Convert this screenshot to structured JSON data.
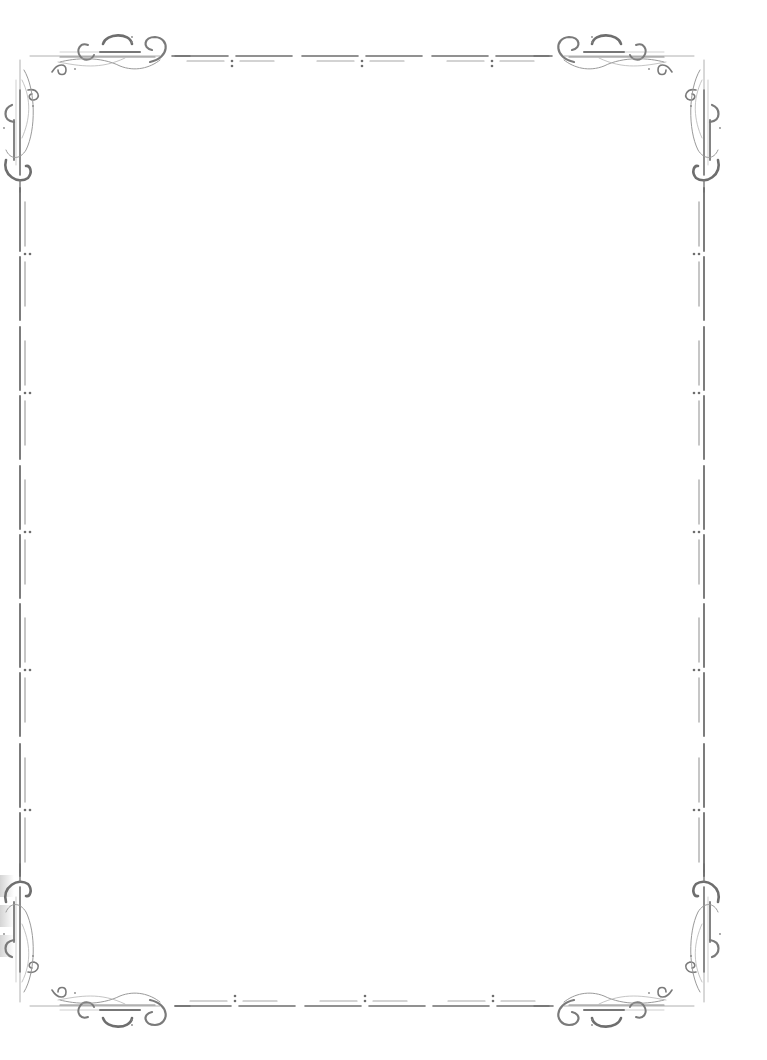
{
  "document": {
    "type": "decorative-page-border",
    "background": "#ffffff",
    "body_text": ""
  },
  "border": {
    "stroke_color": "#6e6e6e",
    "light_stroke_color": "#a8a8a8",
    "top_rule": {
      "y_main": 56,
      "y_inner": 61,
      "x_start": 172,
      "x_end": 556,
      "ornament_x": [
        232,
        362,
        492
      ]
    },
    "bottom_rule": {
      "y_main": 1006,
      "y_inner": 1001,
      "x_start": 172,
      "x_end": 556,
      "ornament_x": [
        235,
        365,
        493
      ]
    },
    "left_rail": {
      "x_main": 20,
      "x_inner": 25,
      "y_start": 190,
      "y_end": 872,
      "ornament_y": [
        254,
        393,
        532,
        670,
        810
      ]
    },
    "right_rail": {
      "x_main": 704,
      "x_inner": 699,
      "y_start": 190,
      "y_end": 872,
      "ornament_y": [
        254,
        393,
        532,
        670,
        810
      ]
    },
    "corners": [
      "top-left-flourish",
      "top-right-flourish",
      "bottom-left-flourish",
      "bottom-right-flourish"
    ]
  }
}
